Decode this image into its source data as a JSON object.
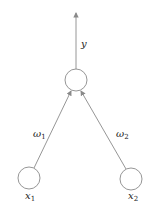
{
  "diagram": {
    "type": "perceptron",
    "colors": {
      "stroke": "#8a8a8a",
      "text": "#222222",
      "background": "#ffffff"
    },
    "nodes": [
      {
        "id": "output",
        "cx": 76,
        "cy": 80,
        "r": 11,
        "label": ""
      },
      {
        "id": "x1",
        "cx": 29,
        "cy": 178,
        "r": 11,
        "label": "x",
        "sub": "1"
      },
      {
        "id": "x2",
        "cx": 131,
        "cy": 179,
        "r": 11,
        "label": "x",
        "sub": "2"
      }
    ],
    "edges": [
      {
        "from": "x1",
        "to": "output",
        "weight_label": "ω",
        "weight_sub": "1"
      },
      {
        "from": "x2",
        "to": "output",
        "weight_label": "ω",
        "weight_sub": "2"
      }
    ],
    "output_arrow": {
      "label": "y"
    }
  }
}
